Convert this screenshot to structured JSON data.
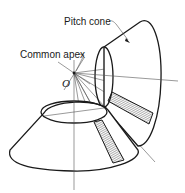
{
  "figure": {
    "type": "technical-illustration",
    "labels": {
      "pitch_cone": "Pitch cone",
      "common_apex": "Common apex",
      "apex_point": "O"
    },
    "colors": {
      "line": "#1a1a1a",
      "construction_line": "#555555",
      "background": "#ffffff"
    }
  }
}
